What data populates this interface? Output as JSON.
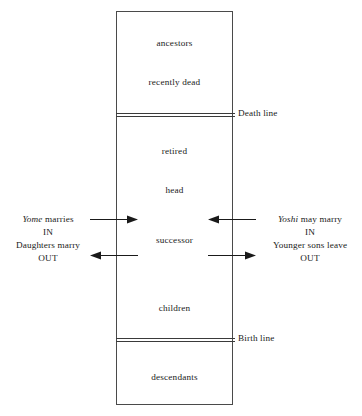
{
  "diagram": {
    "box": {
      "name": "household-box"
    },
    "stages": [
      {
        "key": "ancestors",
        "label": "ancestors"
      },
      {
        "key": "recently_dead",
        "label": "recently dead"
      },
      {
        "key": "retired",
        "label": "retired"
      },
      {
        "key": "head",
        "label": "head"
      },
      {
        "key": "successor",
        "label": "successor"
      },
      {
        "key": "children",
        "label": "children"
      },
      {
        "key": "descendants",
        "label": "descendants"
      }
    ],
    "boundaries": [
      {
        "key": "death_line",
        "label": "Death line"
      },
      {
        "key": "birth_line",
        "label": "Birth line"
      }
    ],
    "left_note": {
      "line1_italic": "Yome",
      "line1_rest": " marries",
      "line2": "IN",
      "line3": "Daughters marry",
      "line4": "OUT"
    },
    "right_note": {
      "line1_italic": "Yoshi",
      "line1_rest": " may marry",
      "line2": "IN",
      "line3": "Younger sons leave",
      "line4": "OUT"
    },
    "arrows": [
      {
        "key": "yome_in",
        "direction": "right",
        "meaning": "Yome marries IN"
      },
      {
        "key": "daughters_out",
        "direction": "left",
        "meaning": "Daughters marry OUT"
      },
      {
        "key": "yoshi_in",
        "direction": "left",
        "meaning": "Yoshi may marry IN"
      },
      {
        "key": "sons_out",
        "direction": "right",
        "meaning": "Younger sons leave OUT"
      }
    ],
    "colors": {
      "ink": "#1a1a1a",
      "rule": "#3a3a3a",
      "box_border": "#4a4a4a",
      "background": "#ffffff"
    }
  }
}
